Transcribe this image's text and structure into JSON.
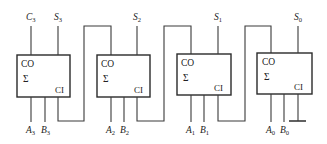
{
  "diagram": {
    "type": "4-bit ripple-carry adder",
    "adders": [
      {
        "co": "CO",
        "sigma": "Σ",
        "ci": "CI",
        "a": "A",
        "a_sub": "3",
        "b": "B",
        "b_sub": "3",
        "s": "S",
        "s_sub": "3"
      },
      {
        "co": "CO",
        "sigma": "Σ",
        "ci": "CI",
        "a": "A",
        "a_sub": "2",
        "b": "B",
        "b_sub": "2",
        "s": "S",
        "s_sub": "2"
      },
      {
        "co": "CO",
        "sigma": "Σ",
        "ci": "CI",
        "a": "A",
        "a_sub": "1",
        "b": "B",
        "b_sub": "1",
        "s": "S",
        "s_sub": "1"
      },
      {
        "co": "CO",
        "sigma": "Σ",
        "ci": "CI",
        "a": "A",
        "a_sub": "0",
        "b": "B",
        "b_sub": "0",
        "s": "S",
        "s_sub": "0"
      }
    ],
    "carry_out": {
      "label": "C",
      "sub": "3"
    },
    "ground": "ground-symbol"
  }
}
